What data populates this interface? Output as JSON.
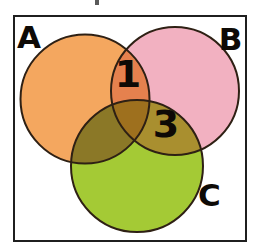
{
  "frame": {
    "border_color": "#1f1f1f",
    "background_color": "#ffffff"
  },
  "venn": {
    "type": "venn",
    "sets": [
      {
        "label": "A",
        "color": "#f4a75f"
      },
      {
        "label": "B",
        "color": "#f2b1c1"
      },
      {
        "label": "C",
        "color": "#a4ca35"
      }
    ],
    "overlaps": {
      "a_b": {
        "region": "A∩B",
        "value": "1",
        "color": "#e5814e"
      },
      "a_c": {
        "region": "A∩C",
        "color": "#8b7827"
      },
      "b_c": {
        "region": "B∩C",
        "value": "3",
        "color": "#a98f2f"
      },
      "a_b_c": {
        "region": "A∩B∩C",
        "color": "#9e701e"
      }
    },
    "outline_color": "#2e2014",
    "label_color": "#0e0a06"
  }
}
